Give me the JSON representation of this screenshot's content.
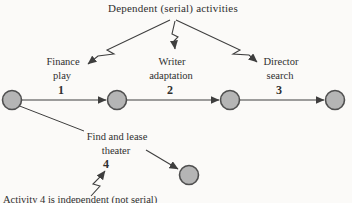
{
  "title": "Dependent (serial) activities",
  "activities": [
    {
      "line1": "Finance",
      "line2": "play",
      "number": "1"
    },
    {
      "line1": "Writer",
      "line2": "adaptation",
      "number": "2"
    },
    {
      "line1": "Director",
      "line2": "search",
      "number": "3"
    },
    {
      "line1": "Find and lease",
      "line2": "theater",
      "number": "4"
    }
  ],
  "caption": "Activity 4 is independent (not serial)",
  "nodes": {
    "count": 5,
    "shape": "circle"
  },
  "icons": [
    "zigzag-arrow-icon-left",
    "zigzag-arrow-icon-middle",
    "zigzag-arrow-icon-right",
    "zigzag-arrow-icon-bottom"
  ],
  "colors": {
    "background": "#fbfaf8",
    "node_fill": "#b5b5b5",
    "node_stroke": "#4f4f4f",
    "line": "#3e3e3e",
    "text": "#2f2f2f"
  }
}
